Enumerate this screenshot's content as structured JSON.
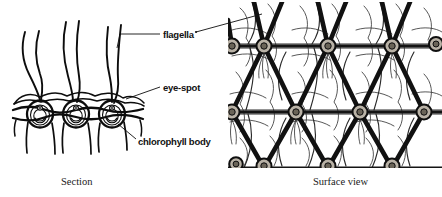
{
  "figure": {
    "background_color": "#ffffff",
    "ink_color": "#111111",
    "node_fill_color": "#b9b2a6",
    "width": 442,
    "height": 197
  },
  "labels": [
    {
      "id": "flagella",
      "text": "flagella",
      "target": "section-flagella"
    },
    {
      "id": "eye-spot",
      "text": "eye-spot",
      "target": "section-eyespot"
    },
    {
      "id": "chlorophyll-body",
      "text": "chlorophyll body",
      "target": "section-chlorophyll"
    }
  ],
  "captions": {
    "left": "Section",
    "right": "Surface view"
  },
  "panels": {
    "section": {
      "caption": "Section",
      "cell_count": 3,
      "flagella_count": 6,
      "features": [
        "flagella",
        "eye-spot",
        "chlorophyll body",
        "gelatinous matrix"
      ]
    },
    "surface": {
      "caption": "Surface view",
      "node_rows": 3,
      "lattice": "triangular-hexagonal mesh"
    }
  }
}
